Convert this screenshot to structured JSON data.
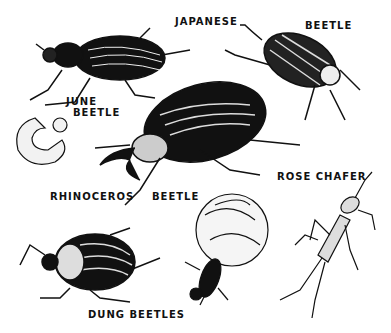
{
  "illustration": {
    "title": "Beetles",
    "colors": {
      "ink": "#111111",
      "paper": "#ffffff",
      "highlight": "#e8e8e8"
    },
    "labels": {
      "japanese_1": "JAPANESE",
      "japanese_2": "BEETLE",
      "june_1": "JUNE",
      "june_2": "BEETLE",
      "rhino_1": "RHINOCEROS",
      "rhino_2": "BEETLE",
      "rose_chafer": "ROSE CHAFER",
      "dung": "DUNG BEETLES"
    },
    "figures": [
      "june-beetle",
      "grub",
      "japanese-beetle",
      "rhinoceros-beetle",
      "rose-chafer",
      "dung-beetle",
      "dung-ball-beetle"
    ]
  }
}
